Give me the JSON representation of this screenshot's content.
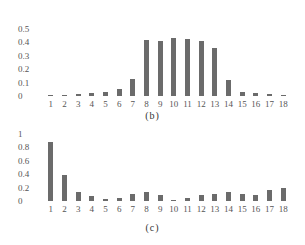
{
  "chart_data": [
    {
      "type": "bar",
      "title": "(b)",
      "xlabel": "",
      "ylabel": "",
      "categories": [
        "1",
        "2",
        "3",
        "4",
        "5",
        "6",
        "7",
        "8",
        "9",
        "10",
        "11",
        "12",
        "13",
        "14",
        "15",
        "16",
        "17",
        "18"
      ],
      "values": [
        0.005,
        0.008,
        0.015,
        0.025,
        0.03,
        0.05,
        0.13,
        0.42,
        0.41,
        0.43,
        0.425,
        0.41,
        0.36,
        0.12,
        0.03,
        0.025,
        0.018,
        0.005
      ],
      "yticks": [
        "0.5",
        "0.4",
        "0.3",
        "0.2",
        "0.1",
        "0"
      ],
      "ylim": [
        0,
        0.5
      ],
      "grid": false,
      "legend": null
    },
    {
      "type": "bar",
      "title": "(c)",
      "xlabel": "",
      "ylabel": "",
      "categories": [
        "1",
        "2",
        "3",
        "4",
        "5",
        "6",
        "7",
        "8",
        "9",
        "10",
        "11",
        "12",
        "13",
        "14",
        "15",
        "16",
        "17",
        "18"
      ],
      "values": [
        0.88,
        0.39,
        0.13,
        0.08,
        0.03,
        0.04,
        0.11,
        0.14,
        0.09,
        0.02,
        0.05,
        0.09,
        0.11,
        0.13,
        0.11,
        0.09,
        0.16,
        0.2
      ],
      "yticks": [
        "1",
        "0.8",
        "0.6",
        "0.4",
        "0.2",
        "0"
      ],
      "ylim": [
        0,
        1
      ],
      "grid": false,
      "legend": null
    }
  ],
  "captions": {
    "b": "(b)",
    "c": "(c)"
  },
  "colors": {
    "bar": "#6b6b6b",
    "text": "#555555"
  }
}
